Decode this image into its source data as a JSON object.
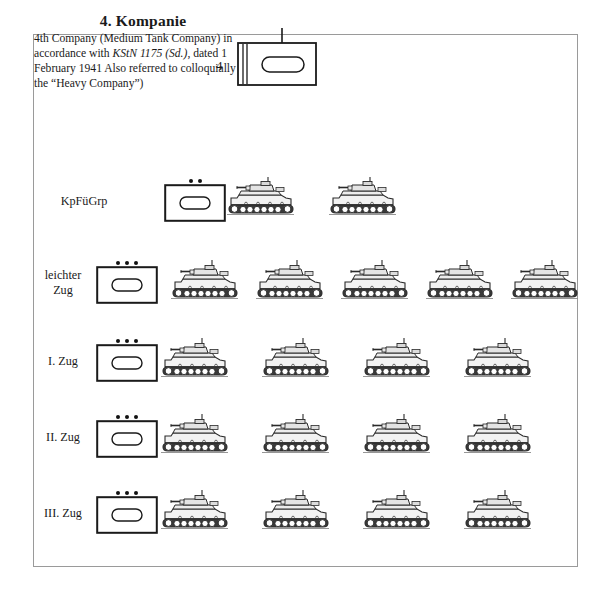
{
  "page": {
    "title": "4. Kompanie",
    "description": "4th Company (Medium Tank Company) in accordance with ",
    "description_italic": "KStN 1175 (Sd.)",
    "description_tail": ", dated 1 February 1941 Also referred to colloquially as the “Heavy Company”)",
    "border_color": "#9a9a9a",
    "ink_color": "#1a1a1a"
  },
  "company_symbol": {
    "size_label": "4",
    "echelon": "company",
    "icon": "armor-track-icon",
    "staff_flag": "vertical-tick"
  },
  "rows": [
    {
      "label": "KpFüGrp",
      "label_line1": "KpFüGrp",
      "label_line2": "",
      "echelon_dots": 2,
      "tanks": 4,
      "tank_count": 2,
      "tank_type": "command-tank"
    },
    {
      "label": "leichter Zug",
      "label_line1": "leichter",
      "label_line2": "Zug",
      "echelon_dots": 3,
      "tank_count": 5,
      "tank_type": "light-tank"
    },
    {
      "label": "I. Zug",
      "label_line1": "I. Zug",
      "label_line2": "",
      "echelon_dots": 3,
      "tank_count": 4,
      "tank_type": "medium-tank"
    },
    {
      "label": "II. Zug",
      "label_line1": "II. Zug",
      "label_line2": "",
      "echelon_dots": 3,
      "tank_count": 4,
      "tank_type": "medium-tank"
    },
    {
      "label": "III. Zug",
      "label_line1": "III. Zug",
      "label_line2": "",
      "echelon_dots": 3,
      "tank_count": 4,
      "tank_type": "medium-tank"
    }
  ]
}
